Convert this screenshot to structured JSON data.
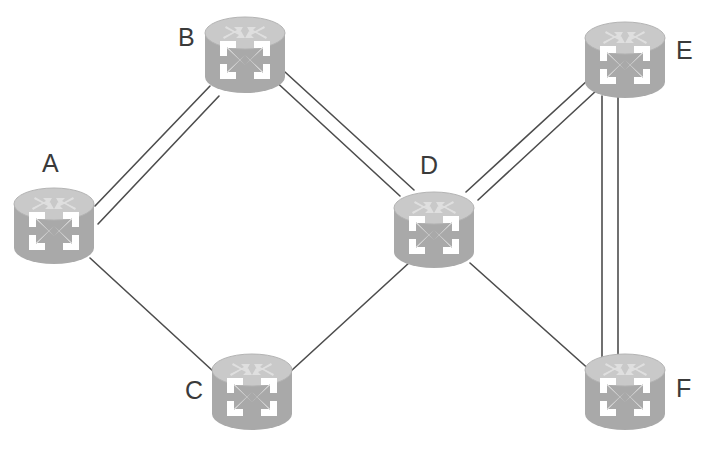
{
  "diagram": {
    "width": 705,
    "height": 451,
    "background_color": "#ffffff",
    "link_color": "#4d4d4d",
    "label_color": "#3a3a3a",
    "node_body_color": "#a9a9a9",
    "node_top_color": "#c9c9c9",
    "node_arrow_color": "#ffffff",
    "icon_name": "router-icon"
  },
  "nodes": [
    {
      "id": "A",
      "label": "A",
      "icon": "router-icon",
      "x": 12,
      "y": 186,
      "w": 84,
      "h": 80,
      "label_x": 42,
      "label_y": 151
    },
    {
      "id": "B",
      "label": "B",
      "icon": "router-icon",
      "x": 203,
      "y": 15,
      "w": 84,
      "h": 80,
      "label_x": 178,
      "label_y": 25
    },
    {
      "id": "C",
      "label": "C",
      "icon": "router-icon",
      "x": 210,
      "y": 352,
      "w": 84,
      "h": 80,
      "label_x": 185,
      "label_y": 378
    },
    {
      "id": "D",
      "label": "D",
      "icon": "router-icon",
      "x": 392,
      "y": 190,
      "w": 84,
      "h": 80,
      "label_x": 420,
      "label_y": 153
    },
    {
      "id": "E",
      "label": "E",
      "icon": "router-icon",
      "x": 583,
      "y": 20,
      "w": 84,
      "h": 80,
      "label_x": 676,
      "label_y": 38
    },
    {
      "id": "F",
      "label": "F",
      "icon": "router-icon",
      "x": 583,
      "y": 352,
      "w": 84,
      "h": 80,
      "label_x": 676,
      "label_y": 376
    }
  ],
  "links": [
    {
      "id": "A-B-1",
      "from": "A",
      "to": "B",
      "x1": 95,
      "y1": 206,
      "x2": 210,
      "y2": 86
    },
    {
      "id": "A-B-2",
      "from": "A",
      "to": "B",
      "x1": 98,
      "y1": 224,
      "x2": 219,
      "y2": 96
    },
    {
      "id": "B-D-1",
      "from": "B",
      "to": "D",
      "x1": 272,
      "y1": 78,
      "x2": 400,
      "y2": 196
    },
    {
      "id": "B-D-2",
      "from": "B",
      "to": "D",
      "x1": 285,
      "y1": 72,
      "x2": 414,
      "y2": 190
    },
    {
      "id": "A-C-1",
      "from": "A",
      "to": "C",
      "x1": 90,
      "y1": 258,
      "x2": 214,
      "y2": 372
    },
    {
      "id": "C-D-1",
      "from": "C",
      "to": "D",
      "x1": 291,
      "y1": 371,
      "x2": 410,
      "y2": 262
    },
    {
      "id": "D-E-1",
      "from": "D",
      "to": "E",
      "x1": 466,
      "y1": 192,
      "x2": 588,
      "y2": 80
    },
    {
      "id": "D-E-2",
      "from": "D",
      "to": "E",
      "x1": 478,
      "y1": 200,
      "x2": 597,
      "y2": 90
    },
    {
      "id": "D-F-1",
      "from": "D",
      "to": "F",
      "x1": 470,
      "y1": 263,
      "x2": 592,
      "y2": 372
    },
    {
      "id": "E-F-1",
      "from": "E",
      "to": "F",
      "x1": 602,
      "y1": 96,
      "x2": 602,
      "y2": 360
    },
    {
      "id": "E-F-2",
      "from": "E",
      "to": "F",
      "x1": 618,
      "y1": 96,
      "x2": 618,
      "y2": 360
    }
  ]
}
